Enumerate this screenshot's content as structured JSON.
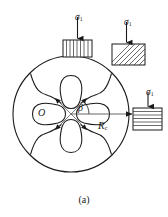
{
  "figure": {
    "caption": "(a)",
    "center_label": "O",
    "angle_label": "β",
    "radius_symbol": "R",
    "radius_subscript": "c",
    "stress_symbol": "σ",
    "stress_subscript": "1"
  },
  "loads": [
    {
      "id": "top",
      "label_symbol": "σ",
      "label_subscript": "1",
      "hatch": "vertical",
      "position": "top"
    },
    {
      "id": "upper-right",
      "label_symbol": "σ",
      "label_subscript": "1",
      "hatch": "diagonal",
      "position": "upper-right"
    },
    {
      "id": "right",
      "label_symbol": "σ",
      "label_subscript": "1",
      "hatch": "horizontal",
      "position": "right"
    }
  ],
  "geometry": {
    "outer_circle": {
      "cx": 71,
      "cy": 114,
      "r": 58
    },
    "lobe_count": 4,
    "arrow_count": 4
  },
  "colors": {
    "stroke": "#1a1a1a",
    "background": "#ffffff",
    "hatch": "#3a3a3a"
  }
}
